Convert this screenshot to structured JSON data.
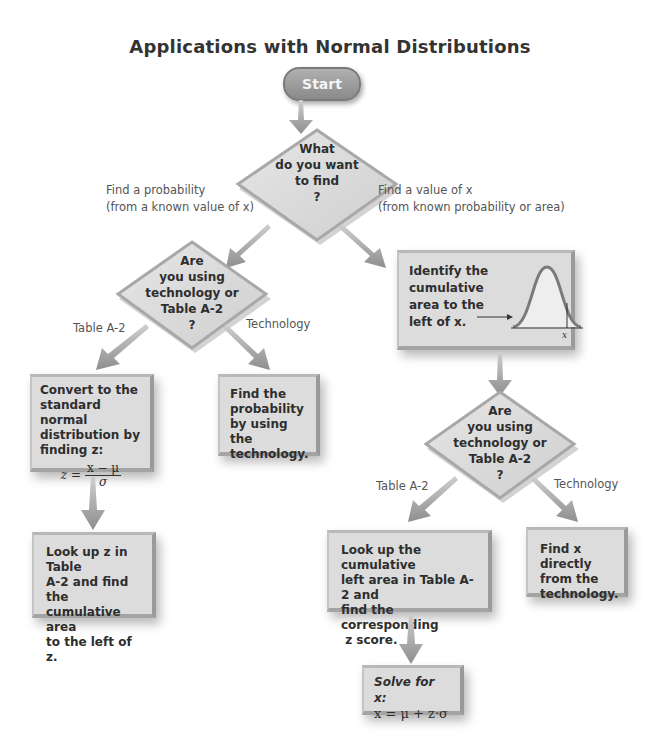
{
  "title": "Applications with Normal Distributions",
  "start": {
    "label": "Start"
  },
  "decision_main": {
    "lines": [
      "What",
      "do you want",
      "to find",
      "?"
    ]
  },
  "branch_left_label": [
    "Find a probability",
    "(from a known value of x)"
  ],
  "branch_right_label": [
    "Find a value of x",
    "(from known probability or area)"
  ],
  "decision_left": {
    "lines": [
      "Are",
      "you using",
      "technology or",
      "Table A-2",
      "?"
    ],
    "label_left": "Table A-2",
    "label_right": "Technology"
  },
  "decision_right": {
    "lines": [
      "Are",
      "you using",
      "technology or",
      "Table A-2",
      "?"
    ],
    "label_left": "Table A-2",
    "label_right": "Technology"
  },
  "box_identify": {
    "lines": [
      "Identify the",
      "cumulative",
      "area to the",
      "left of x."
    ],
    "curve_label": "x"
  },
  "box_convert": {
    "lines": [
      "Convert to the",
      "standard normal",
      "distribution by",
      "finding z:"
    ],
    "formula_lhs": "z =",
    "formula_num": "x − μ",
    "formula_den": "σ"
  },
  "box_find_prob_tech": {
    "lines": [
      "Find the",
      "probability",
      "by using the",
      "technology."
    ]
  },
  "box_lookup_z": {
    "lines": [
      "Look up z in Table",
      "A-2 and find the",
      "cumulative area",
      "to the left of z."
    ]
  },
  "box_lookup_cumulative": {
    "lines": [
      "Look up the cumulative",
      "left area in Table A-2 and",
      "find the corresponding",
      " z score."
    ]
  },
  "box_find_x_tech": {
    "lines": [
      "Find x directly",
      "from the",
      "technology."
    ]
  },
  "box_solve": {
    "line1": "Solve for x:",
    "formula": "x = μ + z·σ"
  },
  "colors": {
    "box_fill": "#dcdcdc",
    "box_border": "#a4a4a4",
    "start_fill": "#9a9a9a",
    "arrow": "#9a9a9a",
    "text": "#2e2e2e",
    "label_text": "#555555"
  }
}
